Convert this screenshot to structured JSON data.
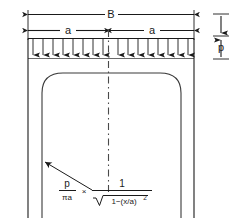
{
  "figure": {
    "background_color": "#ffffff",
    "line_color": "#1a1a1a",
    "curve_color": "#3a3a3a"
  },
  "dimensions": {
    "total_width_label": "B",
    "half_width_label_left": "a",
    "half_width_label_right": "a",
    "load_thickness_label": "p"
  },
  "load": {
    "symbol": "p",
    "arrow_count": 16,
    "direction": "downward"
  },
  "formula": {
    "numerator_left": "p",
    "denominator_left": "πa",
    "multiply_sign": "×",
    "numerator_right": "1",
    "radical_sign": "√",
    "radicand_main": "1−(x/a)",
    "radicand_exponent": "2",
    "full_text": "p/πa × 1/√(1−(x/a)²)"
  },
  "centerline": {
    "style": "dash-dot",
    "label": "axis-of-symmetry"
  }
}
